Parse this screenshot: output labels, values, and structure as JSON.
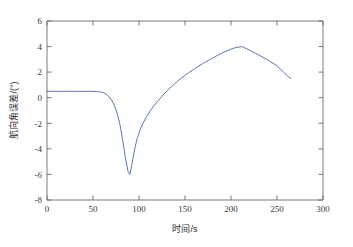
{
  "figure": {
    "background_color": "#ffffff",
    "axis_color": "#6b6b6b",
    "line_color": "#5a77b4"
  },
  "chart_data": {
    "type": "line",
    "title": "",
    "subtitle": "",
    "xlabel": "时间/s",
    "ylabel": "航向角误差/(°)",
    "xlim": [
      0,
      300
    ],
    "ylim": [
      -8,
      6
    ],
    "xticks": [
      0,
      50,
      100,
      150,
      200,
      250,
      300
    ],
    "xticklabels": [
      "0",
      "50",
      "100",
      "150",
      "200",
      "250",
      "300"
    ],
    "yticks": [
      -8,
      -6,
      -4,
      -2,
      0,
      2,
      4,
      6
    ],
    "yticklabels": [
      "-8",
      "-6",
      "-4",
      "-2",
      "0",
      "2",
      "4",
      "6"
    ],
    "grid": false,
    "legend": null,
    "legend_position": "none",
    "annotations": [],
    "series": [
      {
        "name": "航向角误差",
        "color": "#5a77b4",
        "x": [
          0,
          5,
          10,
          15,
          20,
          25,
          30,
          35,
          40,
          45,
          50,
          55,
          58,
          61,
          64,
          67,
          70,
          73,
          76,
          79,
          82,
          85,
          88,
          90,
          92,
          95,
          98,
          101,
          104,
          108,
          112,
          116,
          120,
          125,
          130,
          135,
          140,
          145,
          150,
          155,
          160,
          165,
          170,
          175,
          180,
          185,
          190,
          195,
          200,
          205,
          212,
          220,
          230,
          240,
          250,
          260,
          265
        ],
        "y": [
          0.5,
          0.5,
          0.5,
          0.5,
          0.5,
          0.5,
          0.5,
          0.5,
          0.5,
          0.5,
          0.5,
          0.48,
          0.45,
          0.4,
          0.3,
          0.12,
          -0.15,
          -0.55,
          -1.15,
          -2.0,
          -3.2,
          -4.6,
          -5.75,
          -6.0,
          -5.3,
          -4.1,
          -3.2,
          -2.55,
          -2.05,
          -1.5,
          -1.05,
          -0.65,
          -0.3,
          0.12,
          0.5,
          0.85,
          1.18,
          1.48,
          1.75,
          2.0,
          2.25,
          2.48,
          2.7,
          2.9,
          3.1,
          3.3,
          3.48,
          3.65,
          3.8,
          3.92,
          4.0,
          3.72,
          3.35,
          2.95,
          2.5,
          1.8,
          1.5
        ]
      }
    ],
    "key_points": {
      "initial_value": 0.5,
      "minimum": {
        "x": 90,
        "y": -6.0
      },
      "maximum": {
        "x": 212,
        "y": 4.0
      },
      "final": {
        "x": 265,
        "y": 1.5
      }
    }
  }
}
